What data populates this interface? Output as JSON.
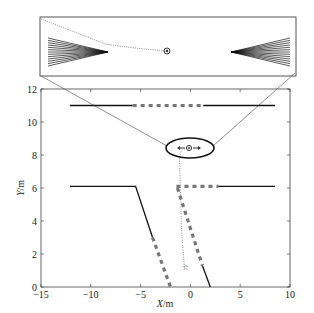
{
  "chart_data": {
    "type": "line",
    "title": "",
    "xlabel": "X/m",
    "ylabel": "Y/m",
    "xlim": [
      -15,
      10
    ],
    "ylim": [
      0,
      12
    ],
    "xticks": [
      -15,
      -10,
      -5,
      0,
      5,
      10
    ],
    "yticks": [
      0,
      2,
      4,
      6,
      8,
      10,
      12
    ],
    "grid": false,
    "legend": null,
    "series": [
      {
        "name": "upper-boundary-left-solid",
        "style": "solid-black",
        "x": [
          -12.1,
          -5.8
        ],
        "y": [
          11,
          11
        ]
      },
      {
        "name": "upper-boundary-dashed",
        "style": "dashed-gray",
        "x": [
          -5.8,
          1.3
        ],
        "y": [
          11,
          11
        ]
      },
      {
        "name": "upper-boundary-right-solid",
        "style": "solid-black",
        "x": [
          1.3,
          8.5
        ],
        "y": [
          11,
          11
        ]
      },
      {
        "name": "lower-left-boundary-solid",
        "style": "solid-black",
        "x": [
          -12.1,
          -5.5,
          -3.8
        ],
        "y": [
          6.1,
          6.1,
          3.0
        ]
      },
      {
        "name": "lower-left-boundary-dashed",
        "style": "dashed-gray",
        "x": [
          -3.8,
          -2.0
        ],
        "y": [
          3.0,
          0
        ]
      },
      {
        "name": "lower-right-horizontal-dashed",
        "style": "dashed-gray",
        "x": [
          -1.4,
          2.8
        ],
        "y": [
          6.1,
          6.1
        ]
      },
      {
        "name": "lower-right-horizontal-solid",
        "style": "solid-black",
        "x": [
          2.8,
          8.5
        ],
        "y": [
          6.1,
          6.1
        ]
      },
      {
        "name": "lower-right-slant-dashed",
        "style": "dashed-gray",
        "x": [
          -1.3,
          1.2
        ],
        "y": [
          6.0,
          1.3
        ]
      },
      {
        "name": "lower-right-slant-solid",
        "style": "solid-black",
        "x": [
          1.2,
          2.0
        ],
        "y": [
          1.3,
          0
        ]
      },
      {
        "name": "vehicle-trajectory",
        "style": "dotted-gray",
        "x": [
          -0.6,
          -0.9,
          -1.0,
          -1.1,
          -0.9,
          -0.3
        ],
        "y": [
          1.2,
          3.5,
          6.0,
          7.8,
          8.3,
          8.4
        ]
      }
    ],
    "markers": [
      {
        "name": "start-star",
        "x": -0.6,
        "y": 1.2
      },
      {
        "name": "target-vehicle",
        "x": -0.2,
        "y": 8.4
      }
    ],
    "annotations": [
      {
        "type": "ellipse-zoom-region",
        "cx": -0.1,
        "cy": 8.4,
        "rx": 2.4,
        "ry": 0.6
      },
      {
        "type": "inset-magnified-view",
        "content": "sensor fans left and right of target vehicle with trajectory"
      }
    ]
  }
}
